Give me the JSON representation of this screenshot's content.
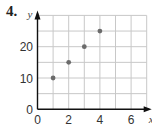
{
  "problem_number": "4.",
  "chart_data": {
    "type": "scatter",
    "title": "",
    "xlabel": "x",
    "ylabel": "y",
    "x": [
      1,
      2,
      3,
      4
    ],
    "y": [
      10,
      15,
      20,
      25
    ],
    "xlim": [
      0,
      7
    ],
    "ylim": [
      0,
      30
    ],
    "x_ticks": [
      0,
      2,
      4,
      6
    ],
    "y_ticks": [
      0,
      10,
      20
    ],
    "x_grid_step": 1,
    "y_grid_step": 5,
    "grid": true,
    "legend": null
  },
  "colors": {
    "point": "#6b6b6b",
    "grid": "#c8c8c8",
    "axis": "#111111"
  }
}
